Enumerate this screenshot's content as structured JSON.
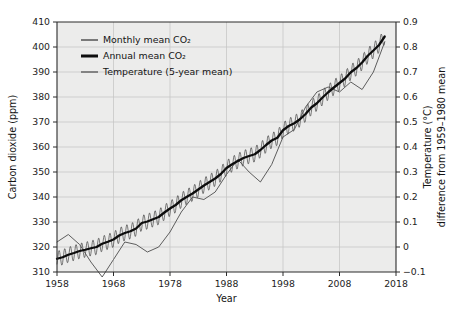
{
  "chart_data": {
    "type": "line",
    "title": "",
    "xlabel": "Year",
    "ylabel": "Carbon dioxide (ppm)",
    "y2label_line1": "Temperature (°C)",
    "y2label_line2": "difference from 1959–1980 mean",
    "grid": true,
    "legend_position": "top-left inside plot",
    "xlim": [
      1958,
      2018
    ],
    "xticks": [
      1958,
      1968,
      1978,
      1988,
      1998,
      2008,
      2018
    ],
    "xtick_labels": [
      "1958",
      "1968",
      "1978",
      "1988",
      "1998",
      "2008",
      "2018"
    ],
    "ylim": [
      310,
      410
    ],
    "yticks": [
      310,
      320,
      330,
      340,
      350,
      360,
      370,
      380,
      390,
      400,
      410
    ],
    "ytick_labels": [
      "310",
      "320",
      "330",
      "340",
      "350",
      "360",
      "370",
      "380",
      "390",
      "400",
      "410"
    ],
    "y2lim": [
      -0.1,
      0.9
    ],
    "y2ticks": [
      -0.1,
      0,
      0.1,
      0.2,
      0.3,
      0.4,
      0.5,
      0.6,
      0.7,
      0.8,
      0.9
    ],
    "y2tick_labels": [
      "−0.1",
      "0",
      "0.1",
      "0.2",
      "0.3",
      "0.4",
      "0.5",
      "0.6",
      "0.7",
      "0.8",
      "0.9"
    ],
    "legend": [
      {
        "label": "Monthly mean CO₂",
        "style": "thin-gray-line",
        "color": "#5c5c5c"
      },
      {
        "label": "Annual mean CO₂",
        "style": "thick-black-line",
        "color": "#0d0d0d"
      },
      {
        "label": "Temperature (5-year mean)",
        "style": "thin-gray-line",
        "color": "#5c5c5c"
      }
    ],
    "series": [
      {
        "name": "Annual mean CO2",
        "axis": "left",
        "units": "ppm",
        "x": [
          1958,
          1959,
          1960,
          1961,
          1962,
          1963,
          1964,
          1965,
          1966,
          1967,
          1968,
          1969,
          1970,
          1971,
          1972,
          1973,
          1974,
          1975,
          1976,
          1977,
          1978,
          1979,
          1980,
          1981,
          1982,
          1983,
          1984,
          1985,
          1986,
          1987,
          1988,
          1989,
          1990,
          1991,
          1992,
          1993,
          1994,
          1995,
          1996,
          1997,
          1998,
          1999,
          2000,
          2001,
          2002,
          2003,
          2004,
          2005,
          2006,
          2007,
          2008,
          2009,
          2010,
          2011,
          2012,
          2013,
          2014,
          2015,
          2016
        ],
        "values": [
          315.3,
          315.9,
          316.9,
          317.6,
          318.4,
          318.9,
          319.5,
          320.0,
          321.3,
          322.1,
          323.0,
          324.6,
          325.6,
          326.3,
          327.4,
          329.6,
          330.2,
          331.1,
          332.0,
          333.8,
          335.4,
          336.8,
          338.7,
          340.1,
          341.4,
          343.0,
          344.6,
          346.0,
          347.4,
          349.2,
          351.6,
          353.1,
          354.4,
          355.6,
          356.4,
          357.1,
          358.8,
          360.8,
          362.6,
          363.7,
          366.7,
          368.4,
          369.5,
          371.1,
          373.2,
          375.8,
          377.5,
          379.8,
          381.9,
          383.8,
          385.6,
          387.4,
          389.9,
          391.6,
          393.8,
          396.5,
          398.6,
          400.8,
          404.2
        ]
      },
      {
        "name": "Monthly mean CO2",
        "axis": "left",
        "units": "ppm",
        "description": "Seasonal sawtooth oscillation of approximately ±3 ppm peak-to-trough about the annual mean, peaking in May and troughing in September",
        "seasonal_amplitude_ppm": 3.1
      },
      {
        "name": "Temperature (5-year mean)",
        "axis": "right",
        "units": "°C",
        "x": [
          1958,
          1960,
          1962,
          1964,
          1966,
          1968,
          1970,
          1972,
          1974,
          1976,
          1978,
          1980,
          1982,
          1984,
          1986,
          1988,
          1990,
          1992,
          1994,
          1996,
          1998,
          2000,
          2002,
          2004,
          2006,
          2008,
          2010,
          2012,
          2014,
          2016
        ],
        "values": [
          0.02,
          0.05,
          0.01,
          -0.06,
          -0.12,
          -0.05,
          0.02,
          0.01,
          -0.02,
          0.0,
          0.06,
          0.14,
          0.2,
          0.19,
          0.22,
          0.29,
          0.35,
          0.3,
          0.26,
          0.33,
          0.44,
          0.47,
          0.56,
          0.62,
          0.64,
          0.62,
          0.66,
          0.63,
          0.7,
          0.82
        ]
      }
    ]
  }
}
